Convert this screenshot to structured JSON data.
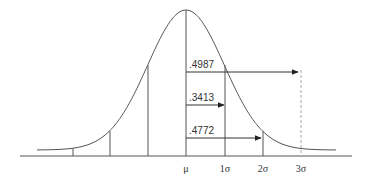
{
  "axis": {
    "labels": [
      {
        "id": "mu",
        "text": "μ",
        "x": 186
      },
      {
        "id": "1sigma",
        "text": "1σ",
        "x": 225
      },
      {
        "id": "2sigma",
        "text": "2σ",
        "x": 263
      },
      {
        "id": "3sigma",
        "text": "3σ",
        "x": 301
      }
    ]
  },
  "areas": [
    {
      "id": "area-3sigma",
      "label": ".4987",
      "from": "μ",
      "to": "3σ",
      "y": 72,
      "x_end": 298
    },
    {
      "id": "area-1sigma",
      "label": ".3413",
      "from": "μ",
      "to": "1σ",
      "y": 105,
      "x_end": 224
    },
    {
      "id": "area-2sigma",
      "label": ".4772",
      "from": "μ",
      "to": "2σ",
      "y": 138,
      "x_end": 261
    }
  ],
  "colors": {
    "line": "#555555",
    "text": "#333333",
    "dashed": "#aaaaaa"
  }
}
